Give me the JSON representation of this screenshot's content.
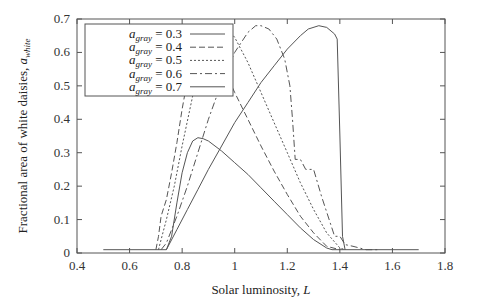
{
  "chart_data": {
    "type": "line",
    "title": "",
    "xlabel": "Solar luminosity, L",
    "ylabel": "Fractional area of white daisies, a_white",
    "xlim": [
      0.4,
      1.8
    ],
    "ylim": [
      0,
      0.7
    ],
    "xticks": [
      "0.4",
      "0.6",
      "0.8",
      "1",
      "1.2",
      "1.4",
      "1.6",
      "1.8"
    ],
    "xtick_values": [
      0.4,
      0.6,
      0.8,
      1.0,
      1.2,
      1.4,
      1.6,
      1.8
    ],
    "yticks": [
      "0",
      "0.1",
      "0.2",
      "0.3",
      "0.4",
      "0.5",
      "0.6",
      "0.7"
    ],
    "ytick_values": [
      0,
      0.1,
      0.2,
      0.3,
      0.4,
      0.5,
      0.6,
      0.7
    ],
    "grid": false,
    "legend_position": "top-left",
    "series": [
      {
        "name": "a_gray = 0.3",
        "legend_prefix": "a",
        "legend_sub": "gray",
        "legend_value": "= 0.3",
        "style": "solid",
        "x": [
          0.5,
          0.74,
          0.76,
          0.78,
          0.8,
          0.82,
          0.84,
          0.86,
          0.88,
          0.9,
          0.95,
          1.0,
          1.05,
          1.1,
          1.15,
          1.2,
          1.25,
          1.3,
          1.35,
          1.37,
          1.7
        ],
        "y": [
          0.01,
          0.01,
          0.05,
          0.15,
          0.24,
          0.3,
          0.335,
          0.345,
          0.342,
          0.335,
          0.305,
          0.27,
          0.235,
          0.195,
          0.155,
          0.115,
          0.075,
          0.04,
          0.015,
          0.01,
          0.01
        ]
      },
      {
        "name": "a_gray = 0.4",
        "legend_prefix": "a",
        "legend_sub": "gray",
        "legend_value": "= 0.4",
        "style": "dashed",
        "x": [
          0.7,
          0.71,
          0.72,
          0.74,
          0.76,
          0.78,
          0.8,
          0.83,
          0.86,
          0.88,
          0.9,
          0.92,
          0.95,
          1.0,
          1.05,
          1.1,
          1.15,
          1.2,
          1.25,
          1.3,
          1.35,
          1.4
        ],
        "y": [
          0.01,
          0.05,
          0.11,
          0.16,
          0.24,
          0.33,
          0.43,
          0.56,
          0.64,
          0.66,
          0.655,
          0.62,
          0.565,
          0.48,
          0.4,
          0.32,
          0.245,
          0.175,
          0.11,
          0.06,
          0.02,
          0.01
        ]
      },
      {
        "name": "a_gray = 0.5",
        "legend_prefix": "a",
        "legend_sub": "gray",
        "legend_value": "= 0.5",
        "style": "dotted",
        "x": [
          0.71,
          0.72,
          0.74,
          0.77,
          0.8,
          0.84,
          0.88,
          0.92,
          0.95,
          0.97,
          1.0,
          1.05,
          1.1,
          1.15,
          1.2,
          1.25,
          1.3,
          1.35,
          1.4,
          1.42
        ],
        "y": [
          0.01,
          0.04,
          0.1,
          0.2,
          0.32,
          0.47,
          0.6,
          0.665,
          0.68,
          0.675,
          0.645,
          0.57,
          0.48,
          0.39,
          0.3,
          0.21,
          0.13,
          0.06,
          0.015,
          0.01
        ]
      },
      {
        "name": "a_gray = 0.6",
        "legend_prefix": "a",
        "legend_sub": "gray",
        "legend_value": "= 0.6",
        "style": "dashdot",
        "x": [
          0.72,
          0.74,
          0.78,
          0.82,
          0.86,
          0.9,
          0.95,
          1.0,
          1.05,
          1.08,
          1.1,
          1.13,
          1.16,
          1.19,
          1.21,
          1.22,
          1.23,
          1.25,
          1.27,
          1.3,
          1.33,
          1.38,
          1.4,
          1.42,
          1.45,
          1.5,
          1.55
        ],
        "y": [
          0.01,
          0.03,
          0.11,
          0.2,
          0.3,
          0.4,
          0.51,
          0.6,
          0.66,
          0.68,
          0.68,
          0.67,
          0.64,
          0.58,
          0.5,
          0.4,
          0.28,
          0.28,
          0.25,
          0.25,
          0.17,
          0.05,
          0.05,
          0.025,
          0.02,
          0.01,
          0.01
        ]
      },
      {
        "name": "a_gray = 0.7",
        "legend_prefix": "a",
        "legend_sub": "gray",
        "legend_value": "= 0.7",
        "style": "solid",
        "x": [
          0.74,
          0.78,
          0.82,
          0.86,
          0.9,
          0.95,
          1.0,
          1.05,
          1.1,
          1.15,
          1.2,
          1.25,
          1.28,
          1.32,
          1.35,
          1.38,
          1.39,
          1.4,
          1.41,
          1.42
        ],
        "y": [
          0.01,
          0.07,
          0.13,
          0.19,
          0.25,
          0.32,
          0.39,
          0.45,
          0.51,
          0.56,
          0.61,
          0.65,
          0.67,
          0.68,
          0.675,
          0.655,
          0.64,
          0.35,
          0.05,
          0.01
        ]
      }
    ]
  }
}
